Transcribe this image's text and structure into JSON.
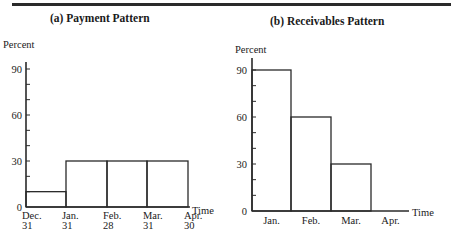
{
  "chart_data": [
    {
      "type": "bar",
      "title": "(a)  Payment Pattern",
      "ylabel": "Percent",
      "xlabel": "Time",
      "ylim": [
        0,
        100
      ],
      "yticks": [
        0,
        30,
        60,
        90
      ],
      "x_edges": [
        "Dec. 31",
        "Jan. 31",
        "Feb. 28",
        "Mar. 31",
        "Apr. 30"
      ],
      "x_edge_lines": [
        [
          "Dec.",
          "31"
        ],
        [
          "Jan.",
          "31"
        ],
        [
          "Feb.",
          "28"
        ],
        [
          "Mar.",
          "31"
        ],
        [
          "Apr.",
          "30"
        ]
      ],
      "categories": [
        "Dec. 31 - Jan. 31",
        "Jan. 31 - Feb. 28",
        "Feb. 28 - Mar. 31",
        "Mar. 31 - Apr. 30"
      ],
      "values": [
        10,
        30,
        30,
        30
      ],
      "grid": false
    },
    {
      "type": "bar",
      "title": "(b)    Receivables Pattern",
      "ylabel": "Percent",
      "xlabel": "Time",
      "ylim": [
        0,
        100
      ],
      "yticks": [
        0,
        30,
        60,
        90
      ],
      "categories": [
        "Jan.",
        "Feb.",
        "Mar.",
        "Apr."
      ],
      "values": [
        90,
        60,
        30,
        0
      ],
      "grid": false
    }
  ]
}
